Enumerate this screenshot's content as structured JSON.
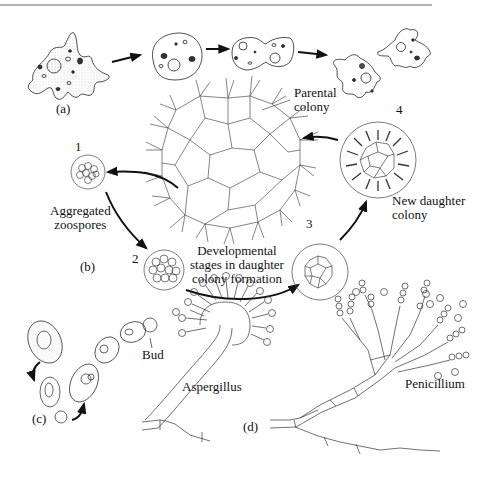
{
  "figure": {
    "top_rule_color": "#9a9a9a",
    "stroke_color": "#222222",
    "panels": {
      "a": {
        "label": "(a)",
        "subject": "amoeba binary fission"
      },
      "b": {
        "label": "(b)",
        "subject": "colonial alga daughter colony formation",
        "parental_colony": "Parental colony",
        "parental_colony_lines": [
          "Parental",
          "colony"
        ],
        "stages": [
          {
            "number": "1",
            "caption_lines": [
              "Aggregated",
              "zoospores"
            ]
          },
          {
            "number": "2",
            "caption_lines": []
          },
          {
            "number": "3",
            "caption_lines": []
          },
          {
            "number": "4",
            "caption_lines": [
              "New daughter",
              "colony"
            ]
          }
        ],
        "center_caption_lines": [
          "Developmental",
          "stages in daughter",
          "colony formation"
        ]
      },
      "c": {
        "label": "(c)",
        "subject": "yeast budding",
        "bud_label": "Bud"
      },
      "d": {
        "label": "(d)",
        "subject": "fungal conidiophores",
        "species": [
          "Aspergillus",
          "Penicillium"
        ]
      }
    }
  }
}
